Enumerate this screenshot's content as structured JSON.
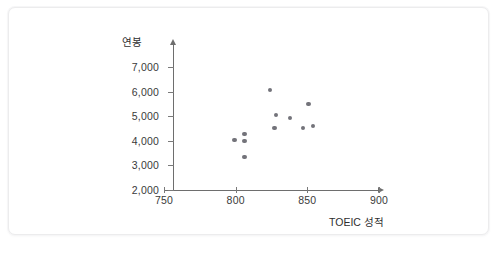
{
  "chart_data": {
    "type": "scatter",
    "title": "",
    "xlabel": "TOEIC 성적",
    "ylabel": "연봉",
    "xlim": [
      750,
      900
    ],
    "ylim": [
      2000,
      7000
    ],
    "xticks": [
      750,
      800,
      850,
      900
    ],
    "xtick_labels": [
      "750",
      "800",
      "850",
      "900"
    ],
    "yticks": [
      2000,
      3000,
      4000,
      5000,
      6000,
      7000
    ],
    "ytick_labels": [
      "2,000",
      "3,000",
      "4,000",
      "5,000",
      "6,000",
      "7,000"
    ],
    "grid": false,
    "legend": null,
    "marker_color": "#73737a",
    "axis_color": "#6e6e6e",
    "points": [
      {
        "x": 799,
        "y": 4030
      },
      {
        "x": 806,
        "y": 4280
      },
      {
        "x": 806,
        "y": 3990
      },
      {
        "x": 806,
        "y": 3340
      },
      {
        "x": 824,
        "y": 6060
      },
      {
        "x": 828,
        "y": 5050
      },
      {
        "x": 827,
        "y": 4520
      },
      {
        "x": 838,
        "y": 4930
      },
      {
        "x": 851,
        "y": 5500
      },
      {
        "x": 847,
        "y": 4520
      },
      {
        "x": 854,
        "y": 4600
      }
    ]
  },
  "axes": {
    "y_title": "연봉",
    "x_title": "TOEIC 성적"
  }
}
